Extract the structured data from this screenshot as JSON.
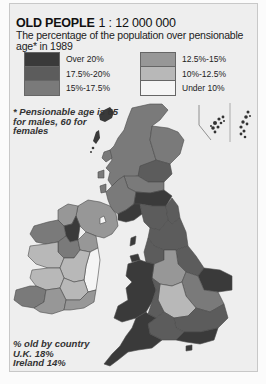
{
  "title": {
    "heading": "OLD PEOPLE",
    "scale": "1 : 12 000 000",
    "subtitle": "The percentage of the population over pensionable age* in 1989"
  },
  "legend": {
    "left": [
      {
        "label": "Over 20%",
        "color": "#3a3a3a"
      },
      {
        "label": "17.5%-20%",
        "color": "#5c5c5c"
      },
      {
        "label": "15%-17.5%",
        "color": "#7a7a7a"
      }
    ],
    "right": [
      {
        "label": "12.5%-15%",
        "color": "#979797"
      },
      {
        "label": "10%-12.5%",
        "color": "#b8b8b8"
      },
      {
        "label": "Under 10%",
        "color": "#f5f5f5"
      }
    ]
  },
  "note": "* Pensionable age is 65 for males, 60 for females",
  "footer": {
    "line1": "% old by country",
    "line2": "U.K. 18%",
    "line3": "Ireland 14%"
  },
  "colors": {
    "frame_bg": "#eeeeee",
    "sea": "#eeeeee",
    "border": "#4a4a4a"
  }
}
